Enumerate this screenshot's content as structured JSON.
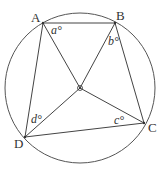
{
  "diagram": {
    "type": "circle-geometry",
    "circle": {
      "cx": 80,
      "cy": 88,
      "r": 75
    },
    "center": {
      "x": 80,
      "y": 88
    },
    "points": {
      "A": {
        "label": "A",
        "x": 43,
        "y": 23
      },
      "B": {
        "label": "B",
        "x": 115,
        "y": 23
      },
      "C": {
        "label": "C",
        "x": 144,
        "y": 123
      },
      "D": {
        "label": "D",
        "x": 25,
        "y": 137
      }
    },
    "angles": {
      "a": "a°",
      "b": "b°",
      "c": "c°",
      "d": "d°"
    },
    "stroke_color": "#444444"
  }
}
